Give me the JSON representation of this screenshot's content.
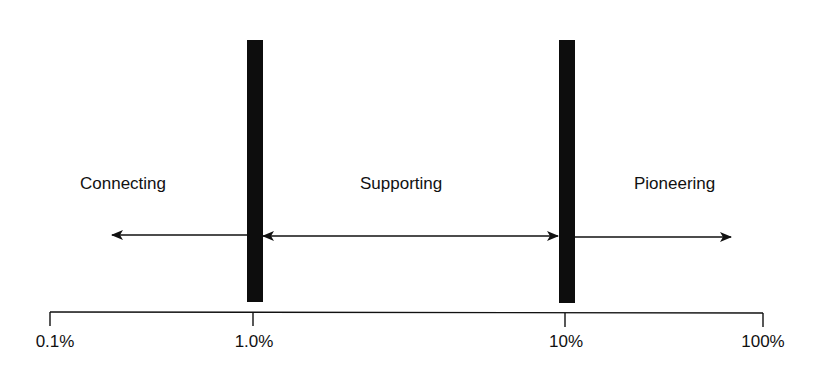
{
  "diagram": {
    "regions": [
      {
        "label": "Connecting",
        "range": "0.1% - 1.0%"
      },
      {
        "label": "Supporting",
        "range": "1.0% - 10%"
      },
      {
        "label": "Pioneering",
        "range": "10% - 100%"
      }
    ],
    "axis": {
      "scale": "log",
      "ticks": [
        "0.1%",
        "1.0%",
        "10%",
        "100%"
      ]
    },
    "dividers": [
      "1.0%",
      "10%"
    ],
    "colors": {
      "ink": "#0d0d0d",
      "background": "#ffffff"
    }
  }
}
